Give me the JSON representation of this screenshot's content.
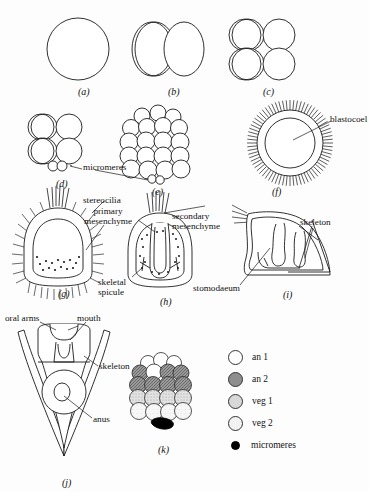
{
  "figure": {
    "background_color": "#fdfdfd",
    "line_color": "#1a1a1a"
  },
  "panels": [
    {
      "id": "a",
      "letter": "(a)",
      "name": "unfertilized-egg",
      "x": 78,
      "y": 86
    },
    {
      "id": "b",
      "letter": "(b)",
      "name": "two-cell-stage",
      "x": 168,
      "y": 86
    },
    {
      "id": "c",
      "letter": "(c)",
      "name": "four-cell-stage",
      "x": 263,
      "y": 86
    },
    {
      "id": "d",
      "letter": "(d)",
      "name": "sixteen-cell-stage",
      "x": 56,
      "y": 178
    },
    {
      "id": "e",
      "letter": "(e)",
      "name": "morula",
      "x": 152,
      "y": 186
    },
    {
      "id": "f",
      "letter": "(f)",
      "name": "blastula",
      "x": 272,
      "y": 186
    },
    {
      "id": "g",
      "letter": "(g)",
      "name": "mesenchyme-blastula",
      "x": 58,
      "y": 288
    },
    {
      "id": "h",
      "letter": "(h)",
      "name": "gastrula",
      "x": 160,
      "y": 296
    },
    {
      "id": "i",
      "letter": "(i)",
      "name": "prism-larva",
      "x": 283,
      "y": 289
    },
    {
      "id": "j",
      "letter": "(j)",
      "name": "pluteus-larva",
      "x": 62,
      "y": 477
    },
    {
      "id": "k",
      "letter": "(k)",
      "name": "fate-map-blastula",
      "x": 158,
      "y": 444
    }
  ],
  "annotations": [
    {
      "id": "micromeres_d",
      "text": "micromeres",
      "x": 74,
      "y": 166
    },
    {
      "id": "blastocoel",
      "text": "blastocoel",
      "x": 310,
      "y": 118
    },
    {
      "id": "stereocilia",
      "text": "stereocilia",
      "x": 83,
      "y": 196
    },
    {
      "id": "primary_mesenchyme",
      "line1": "primary",
      "line2": "mesenchyme",
      "x": 95,
      "y": 212
    },
    {
      "id": "secondary_mesenchyme",
      "line1": "secondary",
      "line2": "mesenchyme",
      "x": 174,
      "y": 217
    },
    {
      "id": "skeleton_i",
      "text": "skeleton",
      "x": 300,
      "y": 221
    },
    {
      "id": "skeletal_spicule",
      "line1": "skeletal",
      "line2": "spicule",
      "x": 110,
      "y": 278
    },
    {
      "id": "stomodaeum",
      "text": "stomodaeum",
      "x": 196,
      "y": 285
    },
    {
      "id": "oral_arms",
      "text": "oral arms",
      "x": 6,
      "y": 316
    },
    {
      "id": "mouth",
      "text": "mouth",
      "x": 77,
      "y": 316
    },
    {
      "id": "skeleton_j",
      "text": "skeleton",
      "x": 100,
      "y": 365
    },
    {
      "id": "anus",
      "text": "anus",
      "x": 93,
      "y": 419
    }
  ],
  "legend": {
    "items": [
      {
        "key": "an1",
        "label": "an 1",
        "swatch": "open-circle",
        "color": "#ffffff"
      },
      {
        "key": "an2",
        "label": "an 2",
        "swatch": "dark-stippled-circle",
        "color": "#8e8e8e"
      },
      {
        "key": "veg1",
        "label": "veg 1",
        "swatch": "medium-stippled-circle",
        "color": "#d8d8d8"
      },
      {
        "key": "veg2",
        "label": "veg 2",
        "swatch": "light-stippled-circle",
        "color": "#f2f2f2"
      },
      {
        "key": "micromeres",
        "label": "micromeres",
        "swatch": "filled-dot",
        "color": "#000000"
      }
    ]
  }
}
